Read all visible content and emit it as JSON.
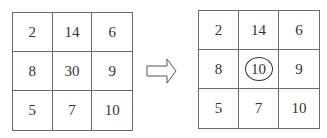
{
  "diagram": {
    "title": "",
    "left_grid": {
      "cells": [
        "2",
        "14",
        "6",
        "8",
        "30",
        "9",
        "5",
        "7",
        "10"
      ]
    },
    "arrow": {
      "direction": "right",
      "icon": "hollow-right-arrow-icon"
    },
    "right_grid": {
      "cells": [
        "2",
        "14",
        "6",
        "8",
        "10",
        "9",
        "5",
        "7",
        "10"
      ],
      "highlighted_index": 4,
      "highlight_style": "circled"
    }
  }
}
